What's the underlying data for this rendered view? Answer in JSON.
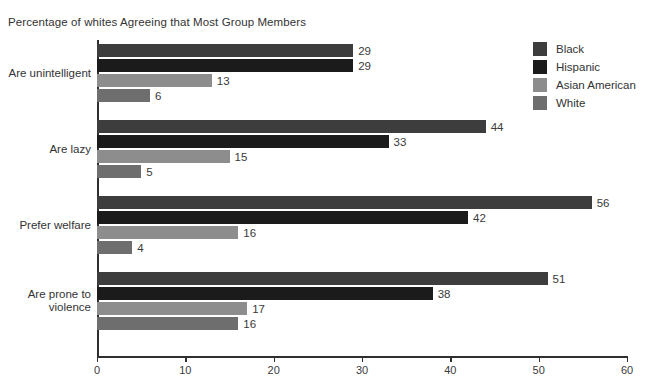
{
  "chart_data": {
    "type": "bar",
    "orientation": "horizontal",
    "title": "Percentage of whites Agreeing that Most Group Members",
    "xlabel": "",
    "ylabel": "",
    "xlim": [
      0,
      60
    ],
    "xticks": [
      0,
      10,
      20,
      30,
      40,
      50,
      60
    ],
    "grid": false,
    "legend_position": "right",
    "categories": [
      "Are unintelligent",
      "Are lazy",
      "Prefer welfare",
      "Are prone to violence"
    ],
    "category_lines": [
      [
        "Are unintelligent"
      ],
      [
        "Are lazy"
      ],
      [
        "Prefer welfare"
      ],
      [
        "Are prone to",
        "violence"
      ]
    ],
    "series": [
      {
        "name": "Black",
        "color": "#3d3d3d",
        "values": [
          29,
          44,
          56,
          51
        ]
      },
      {
        "name": "Hispanic",
        "color": "#1b1b1b",
        "values": [
          29,
          33,
          42,
          38
        ]
      },
      {
        "name": "Asian American",
        "color": "#8d8d8d",
        "values": [
          13,
          15,
          16,
          17
        ]
      },
      {
        "name": "White",
        "color": "#6e6e6e",
        "values": [
          6,
          5,
          4,
          16
        ]
      }
    ],
    "value_labels": [
      [
        "29",
        "29",
        "13",
        "6"
      ],
      [
        "44",
        "33",
        "15",
        "5"
      ],
      [
        "56",
        "42",
        "16",
        "4"
      ],
      [
        "51",
        "38",
        "17",
        "16"
      ]
    ],
    "axis_color": "#2f2f2f"
  }
}
